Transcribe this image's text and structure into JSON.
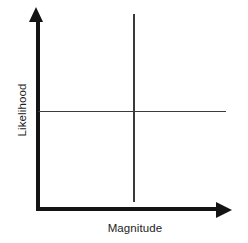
{
  "figure": {
    "type": "quadrant-axes-diagram",
    "background_color": "#ffffff",
    "axis_color": "#141414",
    "divider_color": "#3a3a3a",
    "label_color": "#1d1d1d",
    "x_axis": {
      "label": "Magnitude",
      "arrow": "arrow-right-icon",
      "has_ticks": false,
      "has_tick_labels": false
    },
    "y_axis": {
      "label": "Likelihood",
      "arrow": "arrow-up-icon",
      "orientation": "rotated-90-ccw",
      "has_ticks": false,
      "has_tick_labels": false
    },
    "dividers": {
      "vertical": "quadrant-divider-vertical",
      "horizontal": "quadrant-divider-horizontal"
    }
  },
  "chart_data": {
    "type": "scatter",
    "title": "",
    "subtitle": "",
    "xlabel": "Magnitude",
    "ylabel": "Likelihood",
    "x": [],
    "y": [],
    "series": [],
    "categories": [],
    "values": [],
    "xlim": [
      0,
      1
    ],
    "ylim": [
      0,
      1
    ],
    "xticks": [],
    "yticks": [],
    "xticklabels": [],
    "yticklabels": [],
    "grid": false,
    "legend": false,
    "legend_position": "none",
    "annotations": []
  }
}
